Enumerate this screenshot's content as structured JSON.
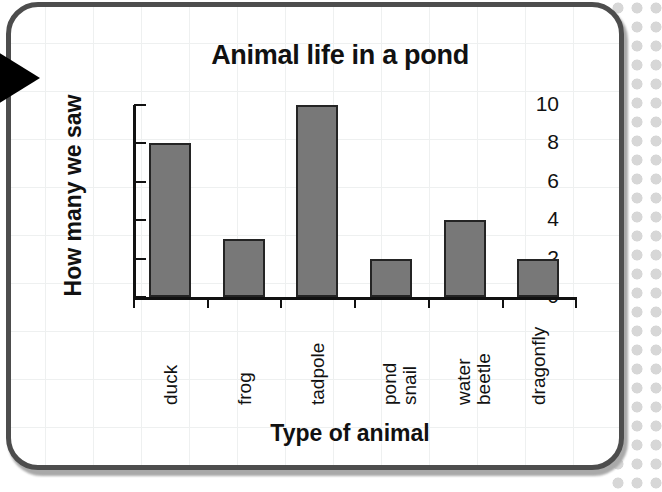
{
  "decorations": {
    "pointer_triangle": "black-right-triangle",
    "dot_pattern": "gray-polka-dots",
    "card_border_color": "#4d4d4d",
    "bar_fill_color": "#787878",
    "bar_edge_color": "#242424",
    "axis_color": "#111111",
    "grid_color": "#eef0f0"
  },
  "chart_data": {
    "type": "bar",
    "title": "Animal life in a pond",
    "xlabel": "Type of animal",
    "ylabel": "How many we saw",
    "categories": [
      "duck",
      "frog",
      "tadpole",
      "pond snail",
      "water beetle",
      "dragonfly"
    ],
    "category_lines": [
      [
        "duck"
      ],
      [
        "frog"
      ],
      [
        "tadpole"
      ],
      [
        "pond",
        "snail"
      ],
      [
        "water",
        "beetle"
      ],
      [
        "dragonfly"
      ]
    ],
    "values": [
      8,
      3,
      10,
      2,
      4,
      2
    ],
    "ylim": [
      0,
      10
    ],
    "ytick_labels": [
      "0",
      "2",
      "4",
      "6",
      "8",
      "10"
    ],
    "ytick_values": [
      0,
      2,
      4,
      6,
      8,
      10
    ],
    "grid": false,
    "legend": "none",
    "xtick_label_rotation": -90
  }
}
